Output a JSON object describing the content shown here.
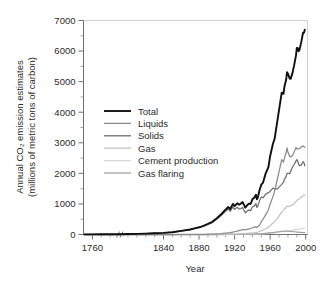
{
  "chart_data": {
    "type": "line",
    "title": "",
    "xlabel": "Year",
    "ylabel": "Annual CO2 emission estimates (millions of metric tons of carbon)",
    "ylabel_line1": "Annual CO₂ emission estimates",
    "ylabel_line2": "(millions of metric tons of carbon)",
    "xlim": [
      1750,
      2002
    ],
    "ylim": [
      0,
      7000
    ],
    "x_ticks": [
      1760,
      1840,
      1880,
      1920,
      1960,
      2000
    ],
    "x_tick_labels": [
      "1760",
      "1840",
      "1880",
      "1920",
      "1960",
      "2000"
    ],
    "x_minor_step": 10,
    "y_ticks": [
      0,
      1000,
      2000,
      3000,
      4000,
      5000,
      6000,
      7000
    ],
    "y_tick_labels": [
      "0",
      "1000",
      "2000",
      "3000",
      "4000",
      "5000",
      "6000",
      "7000"
    ],
    "y_minor_step": 500,
    "grid": false,
    "axis_break": {
      "present": true,
      "symbol": "//",
      "at_x": 1790
    },
    "legend": {
      "position": "upper-left-inside",
      "entries": [
        {
          "name": "Total",
          "color": "#101010",
          "width": 1.9
        },
        {
          "name": "Liquids",
          "color": "#8a8a8a",
          "width": 1.3
        },
        {
          "name": "Solids",
          "color": "#6e6e6e",
          "width": 1.3
        },
        {
          "name": "Gas",
          "color": "#c2c2c2",
          "width": 1.3
        },
        {
          "name": "Cement production",
          "color": "#d8d8d8",
          "width": 1.3
        },
        {
          "name": "Gas flaring",
          "color": "#a0a0a0",
          "width": 1.3
        }
      ]
    },
    "x": [
      1751,
      1760,
      1770,
      1780,
      1790,
      1800,
      1810,
      1820,
      1830,
      1840,
      1850,
      1860,
      1870,
      1875,
      1880,
      1885,
      1890,
      1895,
      1900,
      1905,
      1910,
      1913,
      1915,
      1918,
      1920,
      1923,
      1925,
      1927,
      1929,
      1930,
      1932,
      1934,
      1936,
      1938,
      1940,
      1942,
      1944,
      1945,
      1946,
      1948,
      1950,
      1952,
      1955,
      1958,
      1960,
      1963,
      1965,
      1968,
      1970,
      1973,
      1975,
      1976,
      1978,
      1979,
      1980,
      1982,
      1983,
      1985,
      1987,
      1989,
      1990,
      1991,
      1992,
      1993,
      1995,
      1997,
      1998,
      1999
    ],
    "series": [
      {
        "name": "Total",
        "color": "#101010",
        "values": [
          3,
          4,
          6,
          8,
          10,
          14,
          20,
          29,
          43,
          54,
          74,
          118,
          164,
          200,
          236,
          285,
          345,
          414,
          534,
          663,
          819,
          900,
          830,
          1000,
          932,
          1020,
          975,
          1010,
          1060,
          1000,
          880,
          950,
          1010,
          1000,
          1150,
          1200,
          1300,
          1150,
          1200,
          1450,
          1630,
          1700,
          2000,
          2200,
          2570,
          2950,
          3130,
          3700,
          4080,
          4640,
          4600,
          4830,
          5070,
          5310,
          5260,
          5100,
          5090,
          5270,
          5540,
          5850,
          6100,
          6100,
          5990,
          6040,
          6300,
          6600,
          6600,
          6700
        ]
      },
      {
        "name": "Liquids",
        "color": "#8a8a8a",
        "values": [
          0,
          0,
          0,
          0,
          0,
          0,
          0,
          0,
          0,
          0,
          0,
          1,
          2,
          3,
          5,
          8,
          12,
          16,
          22,
          30,
          46,
          55,
          60,
          78,
          90,
          110,
          128,
          140,
          160,
          160,
          150,
          165,
          185,
          195,
          220,
          240,
          250,
          230,
          250,
          300,
          420,
          500,
          650,
          800,
          1000,
          1230,
          1420,
          1800,
          2060,
          2450,
          2370,
          2490,
          2690,
          2830,
          2690,
          2550,
          2540,
          2580,
          2700,
          2850,
          2800,
          2800,
          2800,
          2810,
          2860,
          2900,
          2870,
          2850
        ]
      },
      {
        "name": "Solids",
        "color": "#6e6e6e",
        "values": [
          3,
          4,
          6,
          8,
          10,
          14,
          20,
          29,
          43,
          54,
          74,
          117,
          162,
          197,
          231,
          277,
          332,
          396,
          509,
          628,
          765,
          835,
          755,
          905,
          825,
          890,
          830,
          850,
          880,
          820,
          710,
          760,
          800,
          780,
          900,
          930,
          1010,
          890,
          920,
          1110,
          1230,
          1200,
          1320,
          1370,
          1410,
          1520,
          1490,
          1490,
          1550,
          1640,
          1710,
          1800,
          1900,
          2000,
          2000,
          1990,
          2060,
          2200,
          2290,
          2400,
          2450,
          2400,
          2300,
          2250,
          2270,
          2380,
          2350,
          2250
        ]
      },
      {
        "name": "Gas",
        "color": "#c2c2c2",
        "values": [
          0,
          0,
          0,
          0,
          0,
          0,
          0,
          0,
          0,
          0,
          0,
          0,
          0,
          0,
          0,
          0,
          1,
          2,
          3,
          4,
          6,
          8,
          9,
          11,
          14,
          18,
          22,
          26,
          32,
          34,
          32,
          36,
          42,
          46,
          54,
          62,
          72,
          72,
          80,
          98,
          120,
          145,
          190,
          240,
          290,
          370,
          430,
          530,
          610,
          740,
          790,
          830,
          900,
          930,
          920,
          920,
          940,
          960,
          1020,
          1080,
          1120,
          1140,
          1150,
          1170,
          1220,
          1270,
          1280,
          1300
        ]
      },
      {
        "name": "Cement production",
        "color": "#d8d8d8",
        "values": [
          0,
          0,
          0,
          0,
          0,
          0,
          0,
          0,
          0,
          0,
          0,
          0,
          0,
          0,
          0,
          0,
          0,
          0,
          0,
          1,
          2,
          3,
          3,
          4,
          5,
          6,
          7,
          8,
          9,
          9,
          8,
          9,
          10,
          11,
          12,
          12,
          13,
          10,
          12,
          15,
          18,
          22,
          28,
          35,
          43,
          53,
          60,
          72,
          82,
          95,
          95,
          100,
          110,
          118,
          120,
          125,
          130,
          140,
          150,
          160,
          165,
          170,
          175,
          180,
          190,
          200,
          205,
          210
        ]
      },
      {
        "name": "Gas flaring",
        "color": "#a0a0a0",
        "values": [
          0,
          0,
          0,
          0,
          0,
          0,
          0,
          0,
          0,
          0,
          0,
          0,
          0,
          0,
          0,
          0,
          0,
          0,
          0,
          0,
          0,
          2,
          3,
          4,
          5,
          6,
          7,
          8,
          9,
          10,
          9,
          10,
          11,
          12,
          14,
          16,
          18,
          18,
          20,
          24,
          23,
          30,
          40,
          50,
          55,
          65,
          73,
          85,
          90,
          105,
          110,
          110,
          110,
          110,
          110,
          105,
          100,
          95,
          90,
          85,
          80,
          78,
          75,
          72,
          68,
          62,
          60,
          58
        ]
      }
    ]
  }
}
